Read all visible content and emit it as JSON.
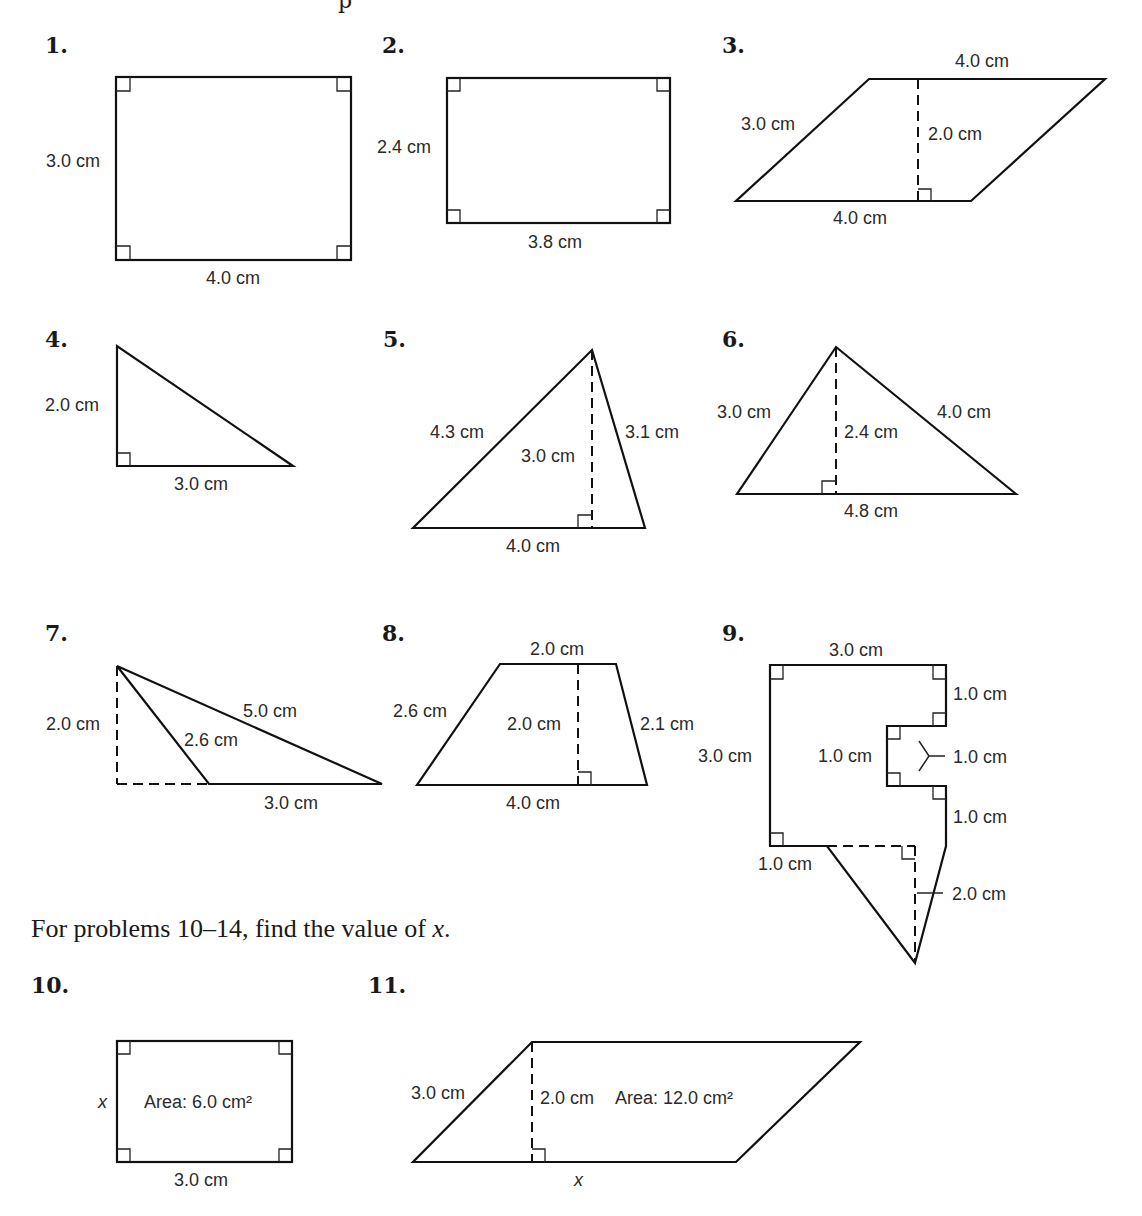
{
  "header_fragment": "p",
  "problems": [
    {
      "number": "1.",
      "shape": "rectangle",
      "labels": {
        "left": "3.0 cm",
        "bottom": "4.0 cm"
      }
    },
    {
      "number": "2.",
      "shape": "rectangle",
      "labels": {
        "left": "2.4 cm",
        "bottom": "3.8 cm"
      }
    },
    {
      "number": "3.",
      "shape": "parallelogram",
      "labels": {
        "top": "4.0 cm",
        "slant": "3.0 cm",
        "height": "2.0 cm",
        "bottom": "4.0 cm"
      }
    },
    {
      "number": "4.",
      "shape": "right-triangle",
      "labels": {
        "left": "2.0 cm",
        "bottom": "3.0 cm"
      }
    },
    {
      "number": "5.",
      "shape": "triangle",
      "labels": {
        "left": "4.3 cm",
        "height": "3.0 cm",
        "right": "3.1 cm",
        "bottom": "4.0 cm"
      }
    },
    {
      "number": "6.",
      "shape": "triangle",
      "labels": {
        "left": "3.0 cm",
        "height": "2.4 cm",
        "right": "4.0 cm",
        "bottom": "4.8 cm"
      }
    },
    {
      "number": "7.",
      "shape": "obtuse-triangle",
      "labels": {
        "height": "2.0 cm",
        "long": "5.0 cm",
        "short": "2.6 cm",
        "bottom": "3.0 cm"
      }
    },
    {
      "number": "8.",
      "shape": "trapezoid",
      "labels": {
        "top": "2.0 cm",
        "left": "2.6 cm",
        "height": "2.0 cm",
        "right": "2.1 cm",
        "bottom": "4.0 cm"
      }
    },
    {
      "number": "9.",
      "shape": "composite",
      "labels": {
        "top": "3.0 cm",
        "right_upper": "1.0 cm",
        "notch_width": "1.0 cm",
        "notch_height": "1.0 cm",
        "left": "3.0 cm",
        "right_lower": "1.0 cm",
        "bottom_left": "1.0 cm",
        "triangle_height": "2.0 cm"
      }
    }
  ],
  "instruction": {
    "text": "For problems 10–14, find the value of ",
    "variable": "x",
    "end": "."
  },
  "find_x_problems": [
    {
      "number": "10.",
      "shape": "rectangle",
      "labels": {
        "left": "x",
        "area": "Area: 6.0 cm²",
        "bottom": "3.0 cm"
      }
    },
    {
      "number": "11.",
      "shape": "parallelogram",
      "labels": {
        "slant": "3.0 cm",
        "height": "2.0 cm",
        "area": "Area: 12.0 cm²",
        "bottom": "x"
      }
    }
  ]
}
